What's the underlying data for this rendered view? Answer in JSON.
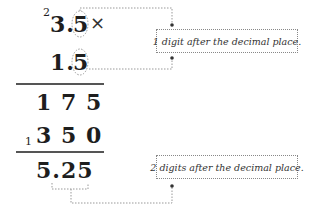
{
  "multiplication": {
    "carry_top": "2",
    "multiplicand": "3.5",
    "multiplicand_int": "3.",
    "multiplicand_dec": "5",
    "operator": "×",
    "multiplier_int": "1.",
    "multiplier_dec": "5",
    "partial_product_1": "1 7 5",
    "carry_bottom": "1",
    "partial_product_2": "3 5 0",
    "result": "5.25"
  },
  "annotations": {
    "top_note": "1 digit after the decimal place.",
    "bottom_note": "2 digits after the decimal place."
  },
  "colors": {
    "text": "#1e1e1e",
    "rule": "#555555",
    "dotted": "#888888"
  }
}
